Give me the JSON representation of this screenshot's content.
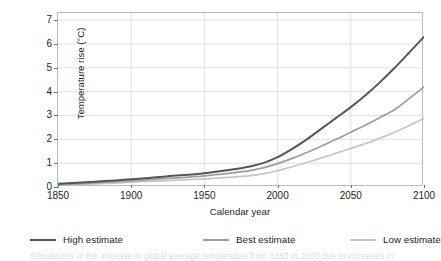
{
  "clipped_text": {
    "top": "",
    "bottom": "Simulations of the increase in global average temperature from 1850 to 2100 due to increases in"
  },
  "chart_data": {
    "type": "line",
    "title": "",
    "xlabel": "Calendar year",
    "ylabel": "Temperature rise (°C)",
    "xlim": [
      1850,
      2100
    ],
    "ylim": [
      0,
      7.3
    ],
    "xticks": [
      1850,
      1900,
      1950,
      2000,
      2050,
      2100
    ],
    "yticks": [
      0,
      1,
      2,
      3,
      4,
      5,
      6,
      7
    ],
    "grid": true,
    "legend_position": "bottom",
    "x": [
      1850,
      1875,
      1900,
      1925,
      1950,
      1970,
      1980,
      1990,
      2000,
      2010,
      2020,
      2030,
      2040,
      2050,
      2060,
      2070,
      2080,
      2090,
      2100
    ],
    "series": [
      {
        "name": "High estimate",
        "color": "#53565c",
        "width": 2.0,
        "values": [
          0.14,
          0.22,
          0.32,
          0.45,
          0.58,
          0.74,
          0.85,
          1.0,
          1.25,
          1.6,
          2.0,
          2.45,
          2.9,
          3.35,
          3.85,
          4.4,
          5.0,
          5.65,
          6.3
        ]
      },
      {
        "name": "Best estimate",
        "color": "#9a9da2",
        "width": 1.7,
        "values": [
          0.1,
          0.17,
          0.26,
          0.36,
          0.47,
          0.6,
          0.68,
          0.8,
          0.98,
          1.2,
          1.45,
          1.72,
          2.0,
          2.3,
          2.6,
          2.92,
          3.25,
          3.72,
          4.2
        ]
      },
      {
        "name": "Low estimate",
        "color": "#c3c6ca",
        "width": 1.7,
        "values": [
          0.08,
          0.13,
          0.2,
          0.27,
          0.34,
          0.42,
          0.47,
          0.55,
          0.68,
          0.85,
          1.03,
          1.22,
          1.42,
          1.62,
          1.82,
          2.05,
          2.3,
          2.58,
          2.88
        ]
      }
    ]
  },
  "legend": {
    "items": [
      {
        "label": "High estimate",
        "color": "#53565c",
        "left": 30
      },
      {
        "label": "Best estimate",
        "color": "#9a9da2",
        "left": 203
      },
      {
        "label": "Low estimate",
        "color": "#c3c6ca",
        "left": 350
      }
    ]
  },
  "colors": {
    "axis": "#b9bcc0",
    "grid": "#d9dbde",
    "text": "#231f20"
  }
}
